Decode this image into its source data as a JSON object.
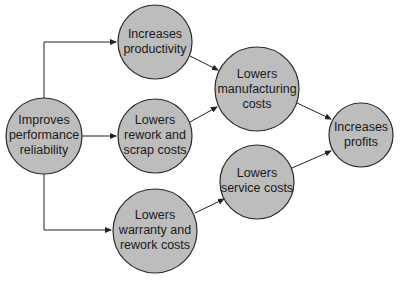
{
  "diagram": {
    "type": "flow",
    "nodes": [
      {
        "id": "improves",
        "lines": [
          "Improves",
          "performance",
          "reliability"
        ],
        "cx": 44,
        "cy": 136,
        "r": 38
      },
      {
        "id": "productivity",
        "lines": [
          "Increases",
          "productivity"
        ],
        "cx": 155,
        "cy": 42,
        "r": 37
      },
      {
        "id": "rework",
        "lines": [
          "Lowers",
          "rework and",
          "scrap costs"
        ],
        "cx": 155,
        "cy": 136,
        "r": 37
      },
      {
        "id": "warranty",
        "lines": [
          "Lowers",
          "warranty and",
          "rework costs"
        ],
        "cx": 155,
        "cy": 231,
        "r": 42
      },
      {
        "id": "manufacturing",
        "lines": [
          "Lowers",
          "manufacturing",
          "costs"
        ],
        "cx": 257,
        "cy": 89,
        "r": 42
      },
      {
        "id": "service",
        "lines": [
          "Lowers",
          "service costs"
        ],
        "cx": 257,
        "cy": 182,
        "r": 37
      },
      {
        "id": "profits",
        "lines": [
          "Increases",
          "profits"
        ],
        "cx": 361,
        "cy": 135,
        "r": 32
      }
    ],
    "edges": [
      {
        "from": "improves",
        "to": "productivity"
      },
      {
        "from": "improves",
        "to": "rework"
      },
      {
        "from": "improves",
        "to": "warranty"
      },
      {
        "from": "productivity",
        "to": "manufacturing"
      },
      {
        "from": "rework",
        "to": "manufacturing"
      },
      {
        "from": "warranty",
        "to": "service"
      },
      {
        "from": "manufacturing",
        "to": "profits"
      },
      {
        "from": "service",
        "to": "profits"
      }
    ]
  },
  "labels": {
    "improves": [
      "Improves",
      "performance",
      "reliability"
    ],
    "productivity": [
      "Increases",
      "productivity"
    ],
    "rework": [
      "Lowers",
      "rework and",
      "scrap costs"
    ],
    "warranty": [
      "Lowers",
      "warranty and",
      "rework costs"
    ],
    "manufacturing": [
      "Lowers",
      "manufacturing",
      "costs"
    ],
    "service": [
      "Lowers",
      "service costs"
    ],
    "profits": [
      "Increases",
      "profits"
    ]
  }
}
